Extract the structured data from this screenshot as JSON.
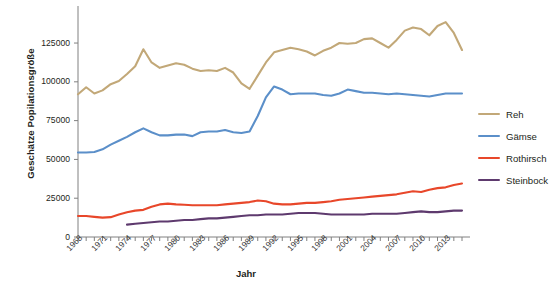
{
  "chart_data": {
    "type": "line",
    "title": "",
    "xlabel": "Jahr",
    "ylabel": "Geschätze Popilationsgröße",
    "xlim": [
      1968,
      2015
    ],
    "ylim": [
      0,
      145000
    ],
    "yticks": [
      0,
      25000,
      50000,
      75000,
      100000,
      125000
    ],
    "ytick_labels": [
      "0",
      "25000",
      "50000",
      "75000",
      "100000",
      "125000"
    ],
    "xticks": [
      1968,
      1971,
      1974,
      1977,
      1980,
      1983,
      1986,
      1989,
      1992,
      1995,
      1998,
      2001,
      2004,
      2007,
      2010,
      2013
    ],
    "xtick_labels": [
      "1968",
      "1971",
      "1974",
      "1977",
      "1980",
      "1983",
      "1986",
      "1989",
      "1992",
      "1995",
      "1998",
      "2001",
      "2004",
      "2007",
      "2010",
      "2013"
    ],
    "grid": false,
    "legend_position": "right",
    "x": [
      1968,
      1969,
      1970,
      1971,
      1972,
      1973,
      1974,
      1975,
      1976,
      1977,
      1978,
      1979,
      1980,
      1981,
      1982,
      1983,
      1984,
      1985,
      1986,
      1987,
      1988,
      1989,
      1990,
      1991,
      1992,
      1993,
      1994,
      1995,
      1996,
      1997,
      1998,
      1999,
      2000,
      2001,
      2002,
      2003,
      2004,
      2005,
      2006,
      2007,
      2008,
      2009,
      2010,
      2011,
      2012,
      2013,
      2014,
      2015
    ],
    "series": [
      {
        "name": "Reh",
        "color": "#c2a878",
        "values": [
          92000,
          96500,
          92500,
          94500,
          98500,
          100500,
          105000,
          110000,
          121000,
          112500,
          109000,
          110500,
          112000,
          111000,
          108500,
          107000,
          107500,
          107000,
          109000,
          106000,
          99000,
          95500,
          104000,
          112500,
          119000,
          120500,
          122000,
          121000,
          119500,
          117000,
          120000,
          122000,
          125000,
          124500,
          125000,
          127500,
          128000,
          125000,
          122000,
          127000,
          133000,
          135000,
          134000,
          130000,
          136000,
          138500,
          131500,
          120500
        ]
      },
      {
        "name": "Gämse",
        "color": "#5b8fc9",
        "values": [
          54500,
          54500,
          54800,
          56500,
          59500,
          62000,
          64500,
          67500,
          70000,
          67500,
          65500,
          65500,
          66000,
          66000,
          65000,
          67500,
          68000,
          68000,
          69000,
          67500,
          67000,
          68000,
          78000,
          90000,
          97000,
          95000,
          92000,
          92500,
          92500,
          92500,
          91500,
          91000,
          92500,
          95000,
          94000,
          93000,
          93000,
          92500,
          92000,
          92500,
          92000,
          91500,
          91000,
          90500,
          91500,
          92500,
          92500,
          92500
        ]
      },
      {
        "name": "Rothirsch",
        "color": "#e8472a",
        "values": [
          13500,
          13500,
          13000,
          12500,
          12800,
          14500,
          16000,
          17000,
          17500,
          19500,
          21000,
          21500,
          21000,
          20800,
          20500,
          20500,
          20500,
          20500,
          21000,
          21500,
          22000,
          22500,
          23500,
          23000,
          21500,
          21000,
          21000,
          21500,
          22000,
          22000,
          22500,
          23000,
          24000,
          24500,
          25000,
          25500,
          26000,
          26500,
          27000,
          27500,
          28500,
          29500,
          29000,
          30500,
          31500,
          32000,
          33500,
          34500
        ]
      },
      {
        "name": "Steinbock",
        "color": "#5e3a6e",
        "values": [
          null,
          null,
          null,
          null,
          null,
          null,
          8000,
          8500,
          9000,
          9500,
          10000,
          10000,
          10500,
          11000,
          11000,
          11500,
          12000,
          12000,
          12500,
          13000,
          13500,
          14000,
          14000,
          14500,
          14500,
          14500,
          15000,
          15500,
          15500,
          15500,
          15000,
          14500,
          14500,
          14500,
          14500,
          14500,
          15000,
          15000,
          15000,
          15000,
          15500,
          16000,
          16500,
          16000,
          16000,
          16500,
          17000,
          17000
        ]
      }
    ]
  },
  "legend": {
    "items": [
      {
        "label": "Reh",
        "color": "#c2a878"
      },
      {
        "label": "Gämse",
        "color": "#5b8fc9"
      },
      {
        "label": "Rothirsch",
        "color": "#e8472a"
      },
      {
        "label": "Steinbock",
        "color": "#5e3a6e"
      }
    ]
  },
  "caption": ""
}
